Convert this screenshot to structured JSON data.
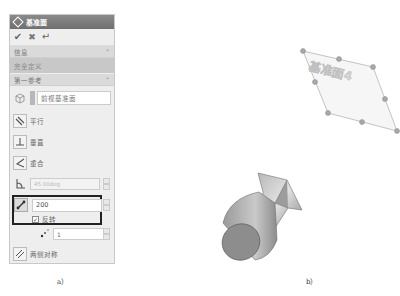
{
  "dialog": {
    "title": "基准面",
    "toolbar": [
      {
        "name": "ok-icon",
        "glyph": "✔"
      },
      {
        "name": "cancel-icon",
        "glyph": "✖"
      },
      {
        "name": "apply-icon",
        "glyph": "↵"
      }
    ],
    "info_section": {
      "header": "信息",
      "body": "完全定义"
    },
    "first_reference": {
      "header": "第一参考",
      "selected_plane": "前视基准面",
      "options": [
        {
          "label": "平行"
        },
        {
          "label": "垂直"
        },
        {
          "label": "重合"
        }
      ],
      "angle_value": "45.00deg",
      "distance_value": "200",
      "reverse_label": "反转",
      "reverse_checked": true,
      "count_value": "1",
      "symmetric_label": "两侧对称"
    }
  },
  "viewport": {
    "plane_label": "基准面4"
  },
  "captions": {
    "a": "a）",
    "b": "b）"
  },
  "colors": {
    "title_bar": "#7a7a7a",
    "panel_bg": "#eeeeee",
    "highlight_border": "#222222",
    "model_gray": "#8c8c8c",
    "plane_handle": "#9a9a9a"
  }
}
